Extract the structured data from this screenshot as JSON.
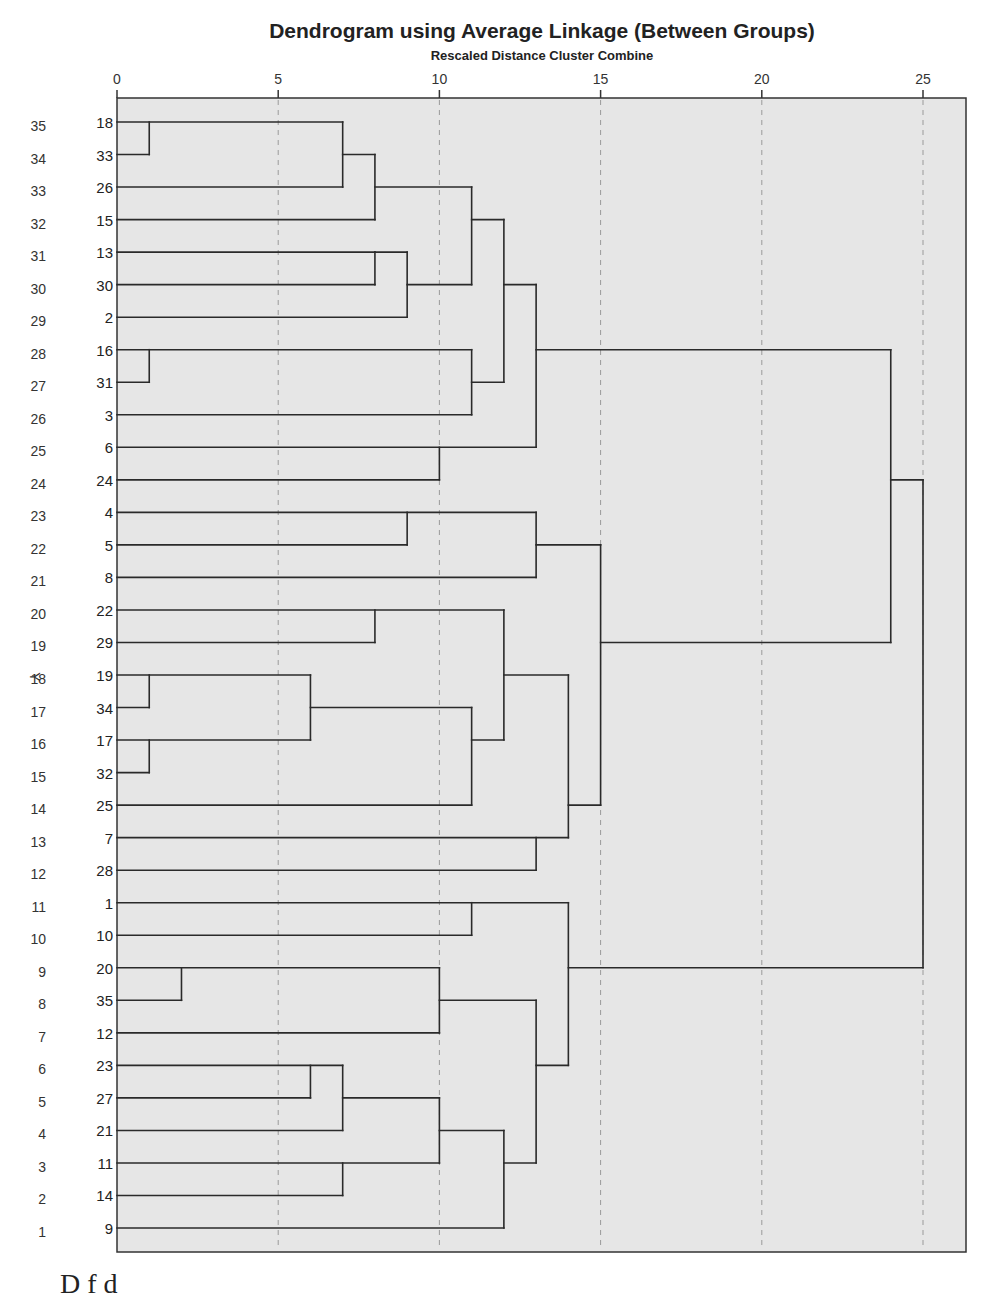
{
  "chart_data": {
    "type": "dendrogram",
    "title": "Dendrogram using Average Linkage (Between Groups)",
    "subtitle": "Rescaled Distance Cluster Combine",
    "xlabel": "Rescaled Distance Cluster Combine",
    "ylabel": "Y",
    "ylabel_row": 18,
    "xlim": [
      0,
      26.3
    ],
    "x_ticks": [
      0,
      5,
      10,
      15,
      20,
      25
    ],
    "grid": "dashed vertical at ticks 5,10,15,20,25",
    "rows": [
      {
        "row": 35,
        "leaf": "18"
      },
      {
        "row": 34,
        "leaf": "33"
      },
      {
        "row": 33,
        "leaf": "26"
      },
      {
        "row": 32,
        "leaf": "15"
      },
      {
        "row": 31,
        "leaf": "13"
      },
      {
        "row": 30,
        "leaf": "30"
      },
      {
        "row": 29,
        "leaf": "2"
      },
      {
        "row": 28,
        "leaf": "16"
      },
      {
        "row": 27,
        "leaf": "31"
      },
      {
        "row": 26,
        "leaf": "3"
      },
      {
        "row": 25,
        "leaf": "6"
      },
      {
        "row": 24,
        "leaf": "24"
      },
      {
        "row": 23,
        "leaf": "4"
      },
      {
        "row": 22,
        "leaf": "5"
      },
      {
        "row": 21,
        "leaf": "8"
      },
      {
        "row": 20,
        "leaf": "22"
      },
      {
        "row": 19,
        "leaf": "29"
      },
      {
        "row": 18,
        "leaf": "19"
      },
      {
        "row": 17,
        "leaf": "34"
      },
      {
        "row": 16,
        "leaf": "17"
      },
      {
        "row": 15,
        "leaf": "32"
      },
      {
        "row": 14,
        "leaf": "25"
      },
      {
        "row": 13,
        "leaf": "7"
      },
      {
        "row": 12,
        "leaf": "28"
      },
      {
        "row": 11,
        "leaf": "1"
      },
      {
        "row": 10,
        "leaf": "10"
      },
      {
        "row": 9,
        "leaf": "20"
      },
      {
        "row": 8,
        "leaf": "35"
      },
      {
        "row": 7,
        "leaf": "12"
      },
      {
        "row": 6,
        "leaf": "23"
      },
      {
        "row": 5,
        "leaf": "27"
      },
      {
        "row": 4,
        "leaf": "21"
      },
      {
        "row": 3,
        "leaf": "11"
      },
      {
        "row": 2,
        "leaf": "14"
      },
      {
        "row": 1,
        "leaf": "9"
      }
    ],
    "horizontal_segments": [
      {
        "row": 35,
        "x1": 0,
        "x2": 7
      },
      {
        "row": 34,
        "x1": 0,
        "x2": 1
      },
      {
        "row": 33,
        "x1": 0,
        "x2": 7
      },
      {
        "row": 32,
        "x1": 0,
        "x2": 8
      },
      {
        "row": 31,
        "x1": 0,
        "x2": 8
      },
      {
        "row": 30,
        "x1": 0,
        "x2": 8
      },
      {
        "row": 29,
        "x1": 0,
        "x2": 9
      },
      {
        "row": 28,
        "x1": 0,
        "x2": 11
      },
      {
        "row": 27,
        "x1": 0,
        "x2": 1
      },
      {
        "row": 26,
        "x1": 0,
        "x2": 11
      },
      {
        "row": 25,
        "x1": 0,
        "x2": 13
      },
      {
        "row": 24,
        "x1": 0,
        "x2": 10
      },
      {
        "row": 23,
        "x1": 0,
        "x2": 13
      },
      {
        "row": 22,
        "x1": 0,
        "x2": 9
      },
      {
        "row": 21,
        "x1": 0,
        "x2": 13
      },
      {
        "row": 20,
        "x1": 0,
        "x2": 12
      },
      {
        "row": 19,
        "x1": 0,
        "x2": 8
      },
      {
        "row": 18,
        "x1": 0,
        "x2": 6
      },
      {
        "row": 17,
        "x1": 0,
        "x2": 1
      },
      {
        "row": 16,
        "x1": 0,
        "x2": 6
      },
      {
        "row": 15,
        "x1": 0,
        "x2": 1
      },
      {
        "row": 14,
        "x1": 0,
        "x2": 11
      },
      {
        "row": 13,
        "x1": 0,
        "x2": 14
      },
      {
        "row": 12,
        "x1": 0,
        "x2": 13
      },
      {
        "row": 11,
        "x1": 0,
        "x2": 14
      },
      {
        "row": 10,
        "x1": 0,
        "x2": 11
      },
      {
        "row": 9,
        "x1": 0,
        "x2": 10
      },
      {
        "row": 8,
        "x1": 0,
        "x2": 2
      },
      {
        "row": 7,
        "x1": 0,
        "x2": 10
      },
      {
        "row": 6,
        "x1": 0,
        "x2": 7
      },
      {
        "row": 5,
        "x1": 0,
        "x2": 6
      },
      {
        "row": 4,
        "x1": 0,
        "x2": 7
      },
      {
        "row": 3,
        "x1": 0,
        "x2": 10
      },
      {
        "row": 2,
        "x1": 0,
        "x2": 7
      },
      {
        "row": 1,
        "x1": 0,
        "x2": 12
      },
      {
        "row": 34,
        "x1": 7,
        "x2": 8
      },
      {
        "row": 33,
        "x1": 8,
        "x2": 11
      },
      {
        "row": 31,
        "x1": 8,
        "x2": 9
      },
      {
        "row": 30,
        "x1": 9,
        "x2": 11
      },
      {
        "row": 32,
        "x1": 11,
        "x2": 12
      },
      {
        "row": 27,
        "x1": 11,
        "x2": 12
      },
      {
        "row": 30,
        "x1": 12,
        "x2": 13
      },
      {
        "row": 28,
        "x1": 13,
        "x2": 24
      },
      {
        "row": 22,
        "x1": 13,
        "x2": 15
      },
      {
        "row": 17,
        "x1": 6,
        "x2": 11
      },
      {
        "row": 16,
        "x1": 11,
        "x2": 12
      },
      {
        "row": 18,
        "x1": 12,
        "x2": 14
      },
      {
        "row": 14,
        "x1": 14,
        "x2": 15
      },
      {
        "row": 19,
        "x1": 15,
        "x2": 24
      },
      {
        "row": 8,
        "x1": 10,
        "x2": 13
      },
      {
        "row": 5,
        "x1": 7,
        "x2": 10
      },
      {
        "row": 4,
        "x1": 10,
        "x2": 12
      },
      {
        "row": 3,
        "x1": 12,
        "x2": 13
      },
      {
        "row": 6,
        "x1": 13,
        "x2": 14
      },
      {
        "row": 9,
        "x1": 14,
        "x2": 25
      },
      {
        "row": 24,
        "x1": 24,
        "x2": 25
      }
    ],
    "vertical_segments": [
      {
        "x": 1,
        "r1": 35,
        "r2": 34
      },
      {
        "x": 7,
        "r1": 35,
        "r2": 33
      },
      {
        "x": 8,
        "r1": 34,
        "r2": 32
      },
      {
        "x": 8,
        "r1": 31,
        "r2": 30
      },
      {
        "x": 9,
        "r1": 31,
        "r2": 29
      },
      {
        "x": 11,
        "r1": 33,
        "r2": 30
      },
      {
        "x": 1,
        "r1": 28,
        "r2": 27
      },
      {
        "x": 11,
        "r1": 28,
        "r2": 26
      },
      {
        "x": 12,
        "r1": 32,
        "r2": 27
      },
      {
        "x": 10,
        "r1": 25,
        "r2": 24
      },
      {
        "x": 13,
        "r1": 30,
        "r2": 25
      },
      {
        "x": 9,
        "r1": 23,
        "r2": 22
      },
      {
        "x": 13,
        "r1": 23,
        "r2": 21
      },
      {
        "x": 8,
        "r1": 20,
        "r2": 19
      },
      {
        "x": 1,
        "r1": 18,
        "r2": 17
      },
      {
        "x": 1,
        "r1": 16,
        "r2": 15
      },
      {
        "x": 6,
        "r1": 18,
        "r2": 16
      },
      {
        "x": 11,
        "r1": 17,
        "r2": 14
      },
      {
        "x": 12,
        "r1": 20,
        "r2": 16
      },
      {
        "x": 13,
        "r1": 13,
        "r2": 12
      },
      {
        "x": 14,
        "r1": 18,
        "r2": 13
      },
      {
        "x": 15,
        "r1": 22,
        "r2": 14
      },
      {
        "x": 11,
        "r1": 11,
        "r2": 10
      },
      {
        "x": 2,
        "r1": 9,
        "r2": 8
      },
      {
        "x": 10,
        "r1": 9,
        "r2": 7
      },
      {
        "x": 6,
        "r1": 6,
        "r2": 5
      },
      {
        "x": 7,
        "r1": 6,
        "r2": 4
      },
      {
        "x": 7,
        "r1": 3,
        "r2": 2
      },
      {
        "x": 10,
        "r1": 5,
        "r2": 3
      },
      {
        "x": 12,
        "r1": 4,
        "r2": 1
      },
      {
        "x": 13,
        "r1": 8,
        "r2": 3
      },
      {
        "x": 14,
        "r1": 11,
        "r2": 6
      },
      {
        "x": 24,
        "r1": 28,
        "r2": 19
      },
      {
        "x": 25,
        "r1": 24,
        "r2": 9
      }
    ],
    "colors": {
      "plot_background": "#e6e6e6",
      "lines": "#2a2a2a",
      "grid": "#9a9a9a",
      "text": "#222222"
    }
  },
  "caption_cropped": "D f d"
}
